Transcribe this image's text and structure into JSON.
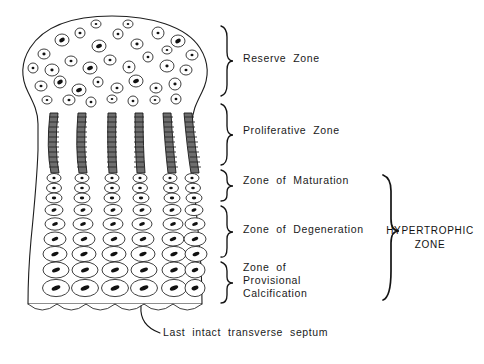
{
  "figure": {
    "background_color": "#ffffff",
    "ink_color": "#1a1a1a"
  },
  "zone_labels": [
    {
      "id": "reserve",
      "label": "Reserve  Zone",
      "lines": [
        "Reserve  Zone"
      ],
      "x": 243,
      "y": 62,
      "brace_top": 26,
      "brace_bottom": 96
    },
    {
      "id": "proliferative",
      "label": "Proliferative  Zone",
      "lines": [
        "Proliferative  Zone"
      ],
      "x": 243,
      "y": 134,
      "brace_top": 104,
      "brace_bottom": 165
    },
    {
      "id": "maturation",
      "label": "Zone  of  Maturation",
      "lines": [
        "Zone  of  Maturation"
      ],
      "x": 243,
      "y": 184,
      "brace_top": 170,
      "brace_bottom": 201
    },
    {
      "id": "degeneration",
      "label": "Zone  of  Degeneration",
      "lines": [
        "Zone  of  Degeneration"
      ],
      "x": 243,
      "y": 233,
      "brace_top": 206,
      "brace_bottom": 257
    },
    {
      "id": "calcification",
      "label": "Zone of Provisional Calcification",
      "lines": [
        "Zone  of",
        "Provisional",
        "Calcification"
      ],
      "x": 243,
      "y": 276,
      "brace_top": 262,
      "brace_bottom": 303
    }
  ],
  "group_bracket": {
    "id": "hypertrophic",
    "lines": [
      "HYPERTROPHIC",
      "ZONE"
    ],
    "label": "HYPERTROPHIC ZONE",
    "text_x": 430,
    "text_y": 234,
    "brace_top": 175,
    "brace_bottom": 300
  },
  "annotation": {
    "id": "septum",
    "label": "Last  intact  transverse  septum",
    "text_x": 163,
    "text_y": 336,
    "pointer_from_x": 141,
    "pointer_from_y": 306,
    "pointer_to_x": 160,
    "pointer_to_y": 333
  },
  "cartilage": {
    "outline_description": "Mushroom-shaped epiphyseal cartilage mass with rounded dome top, narrow waist, flared body and scalloped lower border",
    "dome_top_y": 16,
    "left_edge_x": 18,
    "right_edge_x": 207,
    "bottom_y": 308,
    "column_count": 6,
    "column_x": [
      53,
      80,
      110,
      137,
      165,
      186
    ]
  },
  "cell_populations": [
    {
      "zone": "reserve",
      "appearance": "sparse rounded cells with small dark nuclei, randomly scattered",
      "count": 44
    },
    {
      "zone": "proliferative",
      "appearance": "tall columns of densely stacked flattened dark cells",
      "count": 6
    },
    {
      "zone": "maturation",
      "appearance": "small oval cells in vertical columns, nuclei centered",
      "count": 6
    },
    {
      "zone": "degeneration",
      "appearance": "progressively enlarging oval cells in columns",
      "count": 6
    },
    {
      "zone": "calcification",
      "appearance": "largest hypertrophic cells with prominent elongated nuclei",
      "count": 6
    }
  ]
}
